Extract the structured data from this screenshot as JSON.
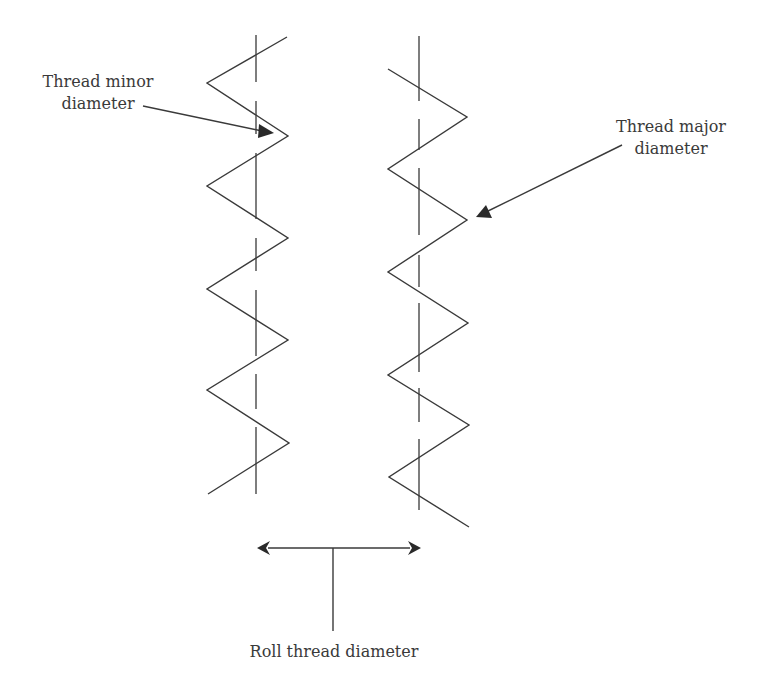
{
  "diagram": {
    "colors": {
      "line": "#3a3a3a",
      "text": "#3a3a3a",
      "background": "#ffffff"
    },
    "labels": {
      "minor": {
        "line1": "Thread minor",
        "line2": "diameter"
      },
      "major": {
        "line1": "Thread major",
        "line2": "diameter"
      },
      "roll": "Roll thread diameter"
    },
    "left_thread": {
      "points": [
        [
          287,
          37
        ],
        [
          207,
          83
        ],
        [
          288,
          136
        ],
        [
          207,
          186
        ],
        [
          288,
          238
        ],
        [
          207,
          289
        ],
        [
          288,
          340
        ],
        [
          207,
          390
        ],
        [
          289,
          443
        ],
        [
          208,
          494
        ]
      ],
      "centerline": {
        "x": 256,
        "y1": 35,
        "y2": 494
      }
    },
    "right_thread": {
      "points": [
        [
          388,
          69
        ],
        [
          467,
          117
        ],
        [
          388,
          169
        ],
        [
          467,
          220
        ],
        [
          388,
          272
        ],
        [
          468,
          323
        ],
        [
          388,
          375
        ],
        [
          469,
          425
        ],
        [
          389,
          477
        ],
        [
          469,
          527
        ]
      ],
      "centerline": {
        "x": 419,
        "y1": 36,
        "y2": 510
      }
    },
    "arrows": {
      "minor": {
        "from": [
          143,
          106
        ],
        "to": [
          273,
          133
        ]
      },
      "major": {
        "from": [
          622,
          145
        ],
        "to": [
          476,
          217
        ]
      },
      "roll_dimension": {
        "y": 548,
        "x1": 257,
        "x2": 421,
        "stem_x": 333,
        "stem_y2": 631
      }
    }
  }
}
